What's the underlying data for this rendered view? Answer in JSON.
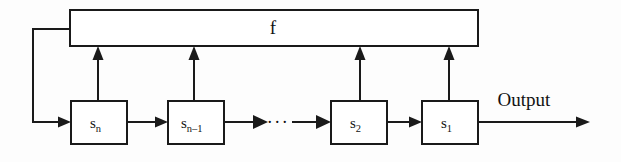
{
  "figure": {
    "type": "block-diagram",
    "background_color": "#fdfdfd",
    "line_color": "#1a1a1a"
  },
  "feedback_block": {
    "label": "f",
    "x": 70,
    "y": 10,
    "width": 408,
    "height": 36
  },
  "stages": [
    {
      "id": "stage-sn",
      "base": "s",
      "subscript": "n",
      "x": 71,
      "y": 101,
      "width": 56,
      "height": 43,
      "tap_x": 98
    },
    {
      "id": "stage-sn-1",
      "base": "s",
      "subscript": "n–1",
      "x": 168,
      "y": 101,
      "width": 56,
      "height": 43,
      "tap_x": 194
    },
    {
      "id": "stage-s2",
      "base": "s",
      "subscript": "2",
      "x": 331,
      "y": 101,
      "width": 56,
      "height": 43,
      "tap_x": 360
    },
    {
      "id": "stage-s1",
      "base": "s",
      "subscript": "1",
      "x": 422,
      "y": 101,
      "width": 56,
      "height": 43,
      "tap_x": 449
    }
  ],
  "ellipsis": {
    "label": "···",
    "x": 278,
    "y": 127
  },
  "output": {
    "label": "Output",
    "label_x": 524,
    "label_y": 103,
    "line_y": 122,
    "line_start_x": 478,
    "line_end_x": 590
  },
  "feedback_wire": {
    "exit_y": 29,
    "turn_x": 33,
    "enter_y": 122,
    "enter_x": 71
  },
  "taps": {
    "from_y": 101,
    "to_y": 46
  }
}
